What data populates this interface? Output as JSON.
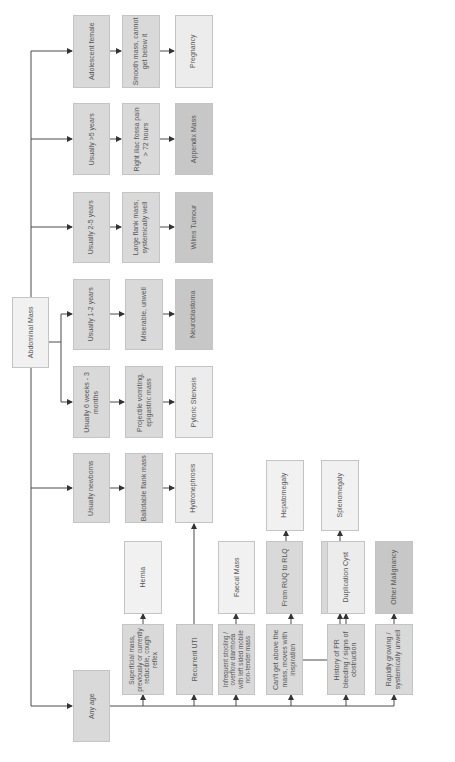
{
  "diagram": {
    "root": "Abdominal Mass",
    "branches": [
      {
        "age": "Adolescent female",
        "finding": "Smooth mass, cannot\nget below it",
        "diagnosis": "Pregnancy"
      },
      {
        "age": "Usually >5 years",
        "finding": "Right iliac fossa pain\n> 72 hours",
        "diagnosis": "Appendix Mass"
      },
      {
        "age": "Usually 2-5 years",
        "finding": "Large flank mass,\nsystemically well",
        "diagnosis": "Wilms Tumour"
      },
      {
        "age": "Usually 1-2 years",
        "finding": "Miserable, unwell",
        "diagnosis": "Neuroblastoma"
      },
      {
        "age": "Usually 6 weeks - 3\nmonths",
        "finding": "Projectile vomiting,\nepigastric mass",
        "diagnosis": "Pyloric Stenosis"
      },
      {
        "age": "Usually newborns",
        "finding": "Ballotable flank mass",
        "diagnosis": "Hydronephrosis"
      }
    ],
    "any_age": {
      "label": "Any age",
      "findings": [
        {
          "finding": "Superficial mass,\npreviously or currently\nreducible, cough\nreflex",
          "diagnosis": "Hernia"
        },
        {
          "finding": "Recurrent UTI",
          "diagnosis": "Hydronephrosis"
        },
        {
          "finding": "Infrequent stooling /\noverflow diarrhoea\nwith left sided mobile\nnon-tender mass",
          "diagnosis": "Faecal Mass"
        },
        {
          "finding": "Can't get above the\nmass, moves with\ninspiration",
          "sub": [
            {
              "route": "From RUQ to RLQ",
              "diagnosis": "Hepatomegaly"
            },
            {
              "route": "From LUQ to RLQ",
              "diagnosis": "Splenomegaly"
            }
          ]
        },
        {
          "finding": "History of PR\nbleeding / signs of\nobstruction",
          "diagnosis": "Duplication Cyst"
        },
        {
          "finding": "Rapidly growing /\nsystemically unwell",
          "diagnosis": "Other Malignancy"
        }
      ]
    }
  },
  "colors": {
    "line": "#4a4a4a",
    "box_mid": "#d9d9d9",
    "box_light": "#ececec",
    "box_dark": "#c7c7c7",
    "border": "#c4c4c4"
  }
}
